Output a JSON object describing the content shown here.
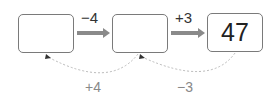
{
  "boxes": [
    {
      "value": ""
    },
    {
      "value": ""
    },
    {
      "value": "47"
    }
  ],
  "forward_ops": [
    "−4",
    "+3"
  ],
  "backward_ops": [
    "+4",
    "−3"
  ],
  "colors": {
    "arrow": "#8a8a8a",
    "box_border": "#7a7a7a",
    "dotted": "#bbbbbb"
  }
}
